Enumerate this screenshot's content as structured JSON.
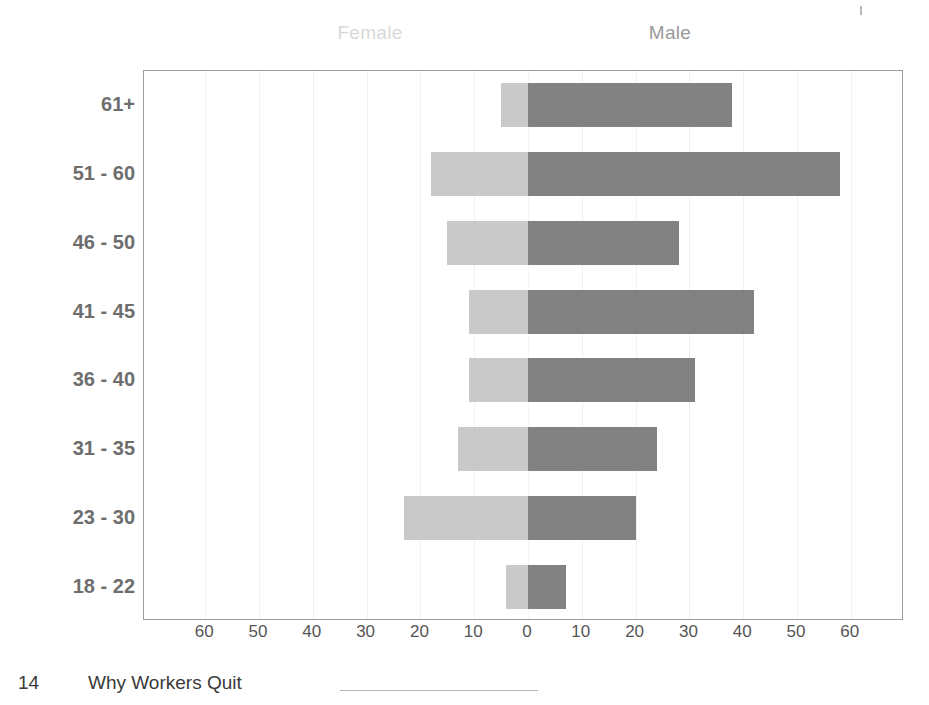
{
  "header": {
    "female_label": "Female",
    "male_label": "Male"
  },
  "footer": {
    "page_number": "14",
    "title": "Why Workers Quit"
  },
  "axis": {
    "x_ticks": [
      "60",
      "50",
      "40",
      "30",
      "20",
      "10",
      "0",
      "10",
      "20",
      "30",
      "40",
      "50",
      "60"
    ],
    "x_tick_values": [
      -60,
      -50,
      -40,
      -30,
      -20,
      -10,
      0,
      10,
      20,
      30,
      40,
      50,
      60
    ]
  },
  "colors": {
    "female_bar": "#c9c9c9",
    "male_bar": "#828282",
    "frame": "#9e9e9e",
    "gridline": "#f0f0f0",
    "label_text": "#6e6e6e",
    "tick_text": "#555555",
    "female_caption": "#d8d8d8",
    "male_caption": "#9a9a9a"
  },
  "chart_data": {
    "type": "bar",
    "subtype": "population-pyramid",
    "orientation": "horizontal",
    "title": "",
    "subtitle": "",
    "xlabel": "",
    "ylabel": "",
    "xlim": [
      -65,
      65
    ],
    "axis_scale_unit": "percent-or-count",
    "grid": true,
    "legend_position": "top",
    "categories": [
      "61+",
      "51 - 60",
      "46 - 50",
      "41 - 45",
      "36 - 40",
      "31 - 35",
      "23 - 30",
      "18 - 22"
    ],
    "series": [
      {
        "name": "Female",
        "direction": "left",
        "color": "#c9c9c9",
        "values": [
          5,
          18,
          15,
          11,
          11,
          13,
          23,
          4
        ]
      },
      {
        "name": "Male",
        "direction": "right",
        "color": "#828282",
        "values": [
          38,
          58,
          28,
          42,
          31,
          24,
          20,
          7
        ]
      }
    ]
  }
}
